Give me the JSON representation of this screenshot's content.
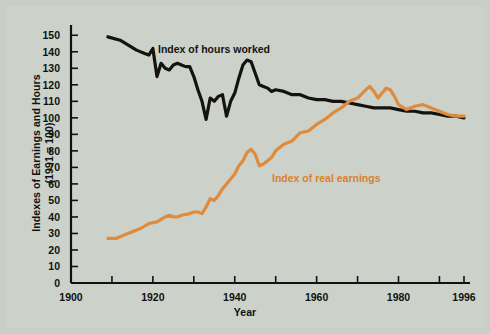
{
  "figure": {
    "background_color": "#ccd2c9",
    "border_color": "#c2c8bf"
  },
  "labels": {
    "ylabel_line1": "Indexes of Earnings and Hours",
    "ylabel_line2": "(1991 = 100)",
    "xlabel": "Year",
    "series_hours": "Index of hours worked",
    "series_earnings": "Index of real earnings"
  },
  "chart_data": {
    "type": "line",
    "title": "",
    "xlabel": "Year",
    "ylabel": "Indexes of Earnings and Hours (1991 = 100)",
    "xlim": [
      1900,
      1996
    ],
    "ylim": [
      0,
      155
    ],
    "yticks": [
      0,
      10,
      20,
      30,
      40,
      50,
      60,
      70,
      80,
      90,
      100,
      110,
      120,
      130,
      140,
      150
    ],
    "ytick_labels": [
      "0",
      "10",
      "20",
      "30",
      "40",
      "50",
      "60",
      "70",
      "80",
      "90",
      "100",
      "110",
      "120",
      "130",
      "140",
      "150"
    ],
    "xticks": [
      1900,
      1910,
      1920,
      1930,
      1940,
      1950,
      1960,
      1970,
      1980,
      1990,
      1996
    ],
    "xtick_labels": [
      "1900",
      "",
      "1920",
      "",
      "1940",
      "",
      "1960",
      "",
      "1980",
      "",
      "1996"
    ],
    "grid": false,
    "legend_position": "inline-annotation",
    "series": [
      {
        "name": "Index of hours worked",
        "color": "#15130f",
        "line_width": 3.2,
        "x": [
          1909,
          1912,
          1914,
          1916,
          1918,
          1919,
          1920,
          1921,
          1922,
          1923,
          1924,
          1925,
          1926,
          1927,
          1928,
          1929,
          1930,
          1931,
          1932,
          1933,
          1934,
          1935,
          1936,
          1937,
          1938,
          1939,
          1940,
          1941,
          1942,
          1943,
          1944,
          1945,
          1946,
          1947,
          1948,
          1949,
          1950,
          1952,
          1954,
          1956,
          1958,
          1960,
          1962,
          1964,
          1966,
          1968,
          1970,
          1972,
          1974,
          1976,
          1978,
          1980,
          1982,
          1984,
          1986,
          1988,
          1990,
          1992,
          1994,
          1996
        ],
        "y": [
          149,
          147,
          144,
          141,
          139,
          138,
          142,
          125,
          133,
          130,
          129,
          132,
          133,
          132,
          131,
          131,
          125,
          117,
          110,
          99,
          112,
          110,
          113,
          114,
          101,
          110,
          115,
          124,
          132,
          135,
          134,
          127,
          120,
          119,
          118,
          116,
          117,
          116,
          114,
          114,
          112,
          111,
          111,
          110,
          110,
          109,
          108,
          107,
          106,
          106,
          106,
          105,
          104,
          104,
          103,
          103,
          102,
          101,
          101,
          100
        ]
      },
      {
        "name": "Index of real earnings",
        "color": "#e08a3c",
        "line_width": 3.2,
        "x": [
          1909,
          1911,
          1913,
          1915,
          1917,
          1919,
          1921,
          1923,
          1924,
          1925,
          1926,
          1927,
          1929,
          1930,
          1931,
          1932,
          1933,
          1934,
          1935,
          1936,
          1937,
          1938,
          1939,
          1940,
          1941,
          1942,
          1943,
          1944,
          1945,
          1946,
          1947,
          1948,
          1949,
          1950,
          1952,
          1954,
          1956,
          1958,
          1960,
          1962,
          1964,
          1966,
          1968,
          1970,
          1972,
          1973,
          1974,
          1975,
          1976,
          1977,
          1978,
          1979,
          1980,
          1982,
          1984,
          1986,
          1988,
          1990,
          1992,
          1994,
          1996
        ],
        "y": [
          27,
          27,
          29,
          31,
          33,
          36,
          37,
          40,
          41,
          40,
          40,
          41,
          42,
          43,
          43,
          42,
          46,
          51,
          50,
          53,
          57,
          60,
          63,
          66,
          71,
          74,
          79,
          81,
          78,
          71,
          72,
          74,
          76,
          80,
          84,
          86,
          91,
          92,
          96,
          99,
          103,
          106,
          110,
          112,
          117,
          119,
          116,
          112,
          115,
          118,
          117,
          113,
          108,
          105,
          107,
          108,
          106,
          104,
          102,
          101,
          101
        ]
      }
    ]
  }
}
